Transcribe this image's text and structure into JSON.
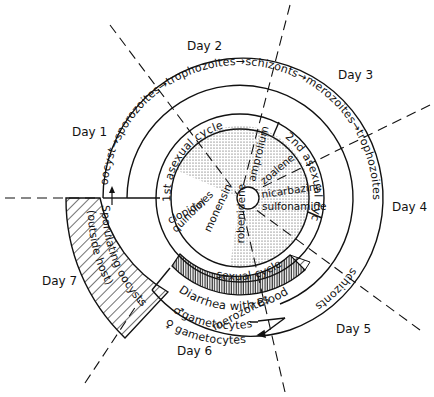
{
  "diagram": {
    "type": "life-cycle-wheel",
    "days": [
      "Day 1",
      "Day 2",
      "Day 3",
      "Day 4",
      "Day 5",
      "Day 6",
      "Day 7"
    ],
    "outer_ring": {
      "sequence_top": "oocyst→sporozoites→trophozoites→schizonts→merozoites→trophozoites",
      "segment_1": "oocyst",
      "segment_2": "sporozoites",
      "segment_3": "trophozoites",
      "segment_4": "schizonts",
      "segment_5": "merozoites",
      "segment_6": "trophozoites",
      "segment_7": "schizonts",
      "segment_8": "merozoites"
    },
    "gametocytes": {
      "male": "♂gametocytes",
      "female": "♀ gametocytes"
    },
    "sporulating": {
      "line1": "Sporulating oocysts",
      "line2": "(outside host)"
    },
    "cycles": {
      "first_asexual": "1st asexual cycle",
      "second_asexual": "2nd asexual cycle",
      "sexual": "sexual cycle",
      "diarrhea": "Diarrhea with Blood"
    },
    "drugs": [
      "clopidol",
      "quinolines",
      "monensin",
      "robenidene",
      "amprolium",
      "zoalene",
      "nicarbazine",
      "sulfonamide"
    ]
  }
}
